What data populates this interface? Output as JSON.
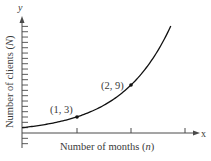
{
  "chart_data": {
    "type": "line",
    "title": "",
    "xlabel": "Number of months (n)",
    "ylabel": "Number of clients (N)",
    "x_axis_letter": "x",
    "y_axis_letter": "y",
    "function": "N = 3^n",
    "x_ticks": [
      1,
      2,
      3
    ],
    "y_tick_step": 1,
    "xlim": [
      0,
      3.2
    ],
    "ylim": [
      -2,
      21
    ],
    "grid": false,
    "legend": null,
    "series": [
      {
        "name": "N = 3^n",
        "x": [
          0,
          0.5,
          1,
          1.5,
          2,
          2.3,
          2.5,
          2.73
        ],
        "values": [
          1,
          1.73,
          3,
          5.2,
          9,
          12.5,
          15.6,
          20
        ]
      }
    ],
    "annotations": [
      {
        "label": "(1, 3)",
        "x": 1,
        "y": 3
      },
      {
        "label": "(2, 9)",
        "x": 2,
        "y": 9
      }
    ]
  },
  "labels": {
    "xlabel_main": "Number of months (",
    "xlabel_var": "n",
    "xlabel_close": ")",
    "ylabel_main": "Number of clients (",
    "ylabel_var": "N",
    "ylabel_close": ")",
    "x_letter": "x",
    "y_letter": "y",
    "point1": "(1, 3)",
    "point2": "(2, 9)"
  },
  "colors": {
    "axis": "#4a4a4a",
    "curve": "#111111",
    "text": "#3a3a3a"
  }
}
